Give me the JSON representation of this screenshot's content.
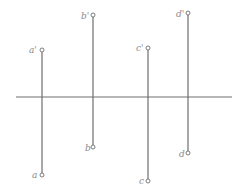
{
  "diagram": {
    "type": "orthographic-projection",
    "axis": {
      "name": "projection-axis"
    },
    "points": [
      {
        "id": "a",
        "upper_label": "a'",
        "lower_label": "a"
      },
      {
        "id": "b",
        "upper_label": "b'",
        "lower_label": "b"
      },
      {
        "id": "c",
        "upper_label": "c'",
        "lower_label": "c"
      },
      {
        "id": "d",
        "upper_label": "d'",
        "lower_label": "d"
      }
    ],
    "colors": {
      "line": "#6e6e6e",
      "label": "#8a8a8a",
      "background": "#ffffff"
    }
  }
}
